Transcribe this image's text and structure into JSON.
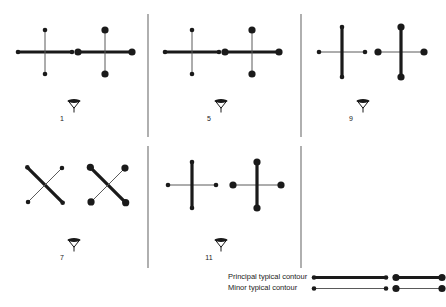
{
  "figure": {
    "type": "contour-symbol-panels",
    "background": "#ffffff",
    "ink": "#1a1a1a",
    "thin_ink": "#5a5a5a",
    "divider_color": "#6e6e6e",
    "panels": [
      {
        "id": "panel-1",
        "label": "1",
        "label_x": 62,
        "label_y": 118,
        "marker_x": 74,
        "marker_y": 101,
        "symbols": [
          {
            "name": "cross-small-dots",
            "cx": 45,
            "cy": 52,
            "shape": "orthogonal-cross",
            "principal_axis": "horizontal",
            "dot_size": "small",
            "arm": 27,
            "minor_arm": 22
          },
          {
            "name": "cross-large-dots",
            "cx": 105,
            "cy": 52,
            "shape": "orthogonal-cross",
            "principal_axis": "horizontal",
            "dot_size": "large",
            "arm": 27,
            "minor_arm": 22
          }
        ]
      },
      {
        "id": "panel-5",
        "label": "5",
        "label_x": 209,
        "label_y": 118,
        "marker_x": 221,
        "marker_y": 101,
        "symbols": [
          {
            "name": "cross-small-dots",
            "cx": 192,
            "cy": 52,
            "shape": "orthogonal-cross",
            "principal_axis": "horizontal",
            "dot_size": "small",
            "arm": 27,
            "minor_arm": 22
          },
          {
            "name": "cross-large-dots",
            "cx": 252,
            "cy": 52,
            "shape": "orthogonal-cross",
            "principal_axis": "horizontal",
            "dot_size": "large",
            "arm": 27,
            "minor_arm": 22
          }
        ]
      },
      {
        "id": "panel-9",
        "label": "9",
        "label_x": 351,
        "label_y": 118,
        "marker_x": 363,
        "marker_y": 101,
        "symbols": [
          {
            "name": "cross-small-dots",
            "cx": 342,
            "cy": 52,
            "shape": "orthogonal-cross",
            "principal_axis": "vertical",
            "dot_size": "small",
            "arm": 25,
            "minor_arm": 23
          },
          {
            "name": "cross-large-dots",
            "cx": 401,
            "cy": 52,
            "shape": "orthogonal-cross",
            "principal_axis": "vertical",
            "dot_size": "large",
            "arm": 25,
            "minor_arm": 23
          }
        ]
      },
      {
        "id": "panel-7",
        "label": "7",
        "label_x": 62,
        "label_y": 257,
        "marker_x": 74,
        "marker_y": 240,
        "symbols": [
          {
            "name": "diagonal-cross-small-dots",
            "cx": 45,
            "cy": 185,
            "shape": "diagonal-cross",
            "principal_axis": "nw-se",
            "dot_size": "small",
            "arm": 25,
            "minor_arm": 24
          },
          {
            "name": "diagonal-cross-large-dots",
            "cx": 108,
            "cy": 185,
            "shape": "diagonal-cross",
            "principal_axis": "nw-se",
            "dot_size": "large",
            "arm": 25,
            "minor_arm": 24
          }
        ]
      },
      {
        "id": "panel-11",
        "label": "11",
        "label_x": 209,
        "label_y": 257,
        "marker_x": 221,
        "marker_y": 240,
        "symbols": [
          {
            "name": "cross-small-dots",
            "cx": 192,
            "cy": 185,
            "shape": "orthogonal-cross",
            "principal_axis": "vertical",
            "dot_size": "small",
            "arm": 23,
            "minor_arm": 24
          },
          {
            "name": "cross-large-dots",
            "cx": 257,
            "cy": 185,
            "shape": "orthogonal-cross",
            "principal_axis": "vertical",
            "dot_size": "large",
            "arm": 23,
            "minor_arm": 24
          }
        ]
      }
    ],
    "dividers": [
      {
        "name": "divider-left-upper",
        "x": 148,
        "y1": 14,
        "y2": 137
      },
      {
        "name": "divider-left-lower",
        "x": 148,
        "y1": 146,
        "y2": 268
      },
      {
        "name": "divider-right-upper",
        "x": 301,
        "y1": 14,
        "y2": 137
      },
      {
        "name": "divider-right-lower",
        "x": 301,
        "y1": 146,
        "y2": 268
      }
    ]
  },
  "legend": {
    "rows": [
      {
        "name": "legend-principal",
        "label": "Principal typical contour",
        "weight": "thick",
        "dot_variants": [
          "small",
          "large"
        ]
      },
      {
        "name": "legend-minor",
        "label": "Minor typical contour",
        "weight": "thin",
        "dot_variants": [
          "small",
          "large"
        ]
      }
    ]
  }
}
